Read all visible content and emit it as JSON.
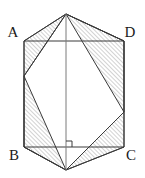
{
  "figure": {
    "type": "geometry-diagram",
    "canvas": {
      "width": 145,
      "height": 178
    },
    "colors": {
      "background": "#ffffff",
      "stroke": "#3a3a3a",
      "hatch": "#5a5a5a",
      "label": "#1a1a1a",
      "inner_fill": "#ffffff"
    },
    "stroke_width": 1,
    "hatch": {
      "direction": "forward-slash",
      "spacing": 3,
      "line_width": 0.55
    },
    "labels": [
      {
        "id": "A",
        "text": "A",
        "x": 13,
        "y": 37,
        "anchor": "middle"
      },
      {
        "id": "D",
        "text": "D",
        "x": 130,
        "y": 37,
        "anchor": "middle"
      },
      {
        "id": "B",
        "text": "B",
        "x": 14,
        "y": 160,
        "anchor": "middle"
      },
      {
        "id": "C",
        "text": "C",
        "x": 131,
        "y": 160,
        "anchor": "middle"
      }
    ],
    "points": {
      "A": {
        "x": 24,
        "y": 41
      },
      "D": {
        "x": 124,
        "y": 41
      },
      "B": {
        "x": 24,
        "y": 147
      },
      "C": {
        "x": 124,
        "y": 147
      },
      "top_apex": {
        "x": 66,
        "y": 14
      },
      "bottom_apex": {
        "x": 66,
        "y": 170
      },
      "inner_left": {
        "x": 24,
        "y": 76
      },
      "inner_right": {
        "x": 124,
        "y": 112
      }
    },
    "outer_hexagon": "24,41 66,14 124,41 124,147 66,170 24,147",
    "rectangle": "24,41 124,41 124,147 24,147",
    "inner_hexagon": "66,14 124,41 124,112 66,170 24,147 24,76",
    "vertical_axis": {
      "x1": 66,
      "y1": 14,
      "x2": 66,
      "y2": 170
    },
    "right_angle_marker": {
      "x": 66,
      "y": 147,
      "size": 6,
      "corner": "upper-right"
    },
    "segments": [
      {
        "name": "top-apex-to-A",
        "x1": 66,
        "y1": 14,
        "x2": 24,
        "y2": 41
      },
      {
        "name": "top-apex-to-D",
        "x1": 66,
        "y1": 14,
        "x2": 124,
        "y2": 41
      },
      {
        "name": "top-apex-to-inner-left",
        "x1": 66,
        "y1": 14,
        "x2": 24,
        "y2": 76
      },
      {
        "name": "top-apex-to-inner-right",
        "x1": 66,
        "y1": 14,
        "x2": 124,
        "y2": 112
      },
      {
        "name": "bottom-apex-to-B",
        "x1": 66,
        "y1": 170,
        "x2": 24,
        "y2": 147
      },
      {
        "name": "bottom-apex-to-C",
        "x1": 66,
        "y1": 170,
        "x2": 124,
        "y2": 147
      },
      {
        "name": "bottom-apex-to-inner-left",
        "x1": 66,
        "y1": 170,
        "x2": 24,
        "y2": 76
      },
      {
        "name": "bottom-apex-to-inner-right",
        "x1": 66,
        "y1": 170,
        "x2": 124,
        "y2": 112
      }
    ],
    "hatched_regions": [
      {
        "name": "top-left-wedge",
        "points": "24,41 66,14 24,76"
      },
      {
        "name": "top-right-wedge",
        "points": "66,14 124,41 124,112"
      },
      {
        "name": "bottom-left-wedge",
        "points": "24,76 24,147 66,170"
      },
      {
        "name": "bottom-right-wedge",
        "points": "124,112 124,147 66,170"
      }
    ]
  }
}
